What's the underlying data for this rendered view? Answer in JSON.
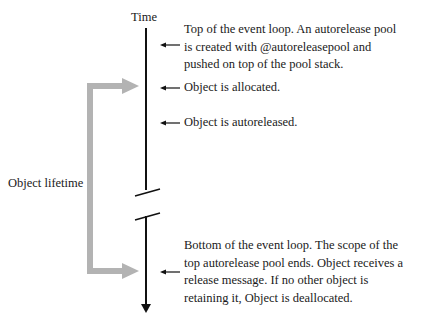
{
  "diagram": {
    "axis_label": "Time",
    "bracket_label": "Object lifetime",
    "events": [
      {
        "text": "Top of the event loop. An autorelease pool is created with @autoreleasepool and pushed on top of the pool stack."
      },
      {
        "text": "Object is allocated."
      },
      {
        "text": "Object is autoreleased."
      },
      {
        "text": "Bottom of the event loop. The scope of the top autorelease pool ends. Object receives a release message. If no other object is retaining it, Object is deallocated."
      }
    ],
    "colors": {
      "timeline": "#111111",
      "bracket": "#b3b3b3",
      "text": "#1a1a1a"
    }
  }
}
